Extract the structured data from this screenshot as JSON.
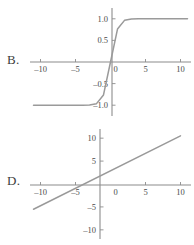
{
  "figure": {
    "background_color": "#ffffff",
    "axis_color": "#8c8c8c",
    "curve_color": "#9a9a9a",
    "text_color": "#4a4a4a"
  },
  "panels": {
    "b": {
      "label": "B."
    },
    "d": {
      "label": "D."
    }
  },
  "chart_data": [
    {
      "type": "line",
      "panel_label": "B.",
      "title": "",
      "xlabel": "",
      "ylabel": "",
      "xlim": [
        -11.5,
        11.5
      ],
      "ylim": [
        -1.25,
        1.25
      ],
      "grid": false,
      "legend": "none",
      "xticks": [
        -10,
        -5,
        0,
        5,
        10
      ],
      "xtick_labels": [
        "–10",
        "–5",
        "0",
        "5",
        "10"
      ],
      "yticks": [
        -1.0,
        -0.5,
        0.5,
        1.0
      ],
      "ytick_labels": [
        "–1.0",
        "–0.5",
        "0.5",
        "1.0"
      ],
      "origin_label": "0",
      "description": "sigmoid / hyperbolic tangent curve with horizontal asymptotes at y = -1.0 and y = 1.0, passing through the origin",
      "x": [
        -11,
        -10,
        -9,
        -8,
        -7,
        -6,
        -5,
        -4,
        -3,
        -2,
        -1,
        0,
        1,
        2,
        3,
        4,
        5,
        6,
        7,
        8,
        9,
        10,
        11
      ],
      "y": [
        -1.0,
        -1.0,
        -1.0,
        -1.0,
        -1.0,
        -0.999,
        -0.999,
        -0.999,
        -0.995,
        -0.964,
        -0.762,
        0.0,
        0.762,
        0.964,
        0.995,
        0.999,
        0.999,
        0.999,
        1.0,
        1.0,
        1.0,
        1.0,
        1.0
      ]
    },
    {
      "type": "line",
      "panel_label": "D.",
      "title": "",
      "xlabel": "",
      "ylabel": "",
      "xlim": [
        -11.5,
        11.5
      ],
      "ylim": [
        -12,
        12
      ],
      "grid": false,
      "legend": "none",
      "xticks": [
        -10,
        -5,
        0,
        5,
        10
      ],
      "xtick_labels": [
        "–10",
        "–5",
        "0",
        "5",
        "10"
      ],
      "yticks": [
        -10,
        -5,
        5,
        10
      ],
      "ytick_labels": [
        "–10",
        "–5",
        "5",
        "10"
      ],
      "origin_label": "0",
      "description": "straight line through the origin with slope approximately 1",
      "x": [
        -11,
        10
      ],
      "y": [
        -5.5,
        10.5
      ]
    }
  ]
}
